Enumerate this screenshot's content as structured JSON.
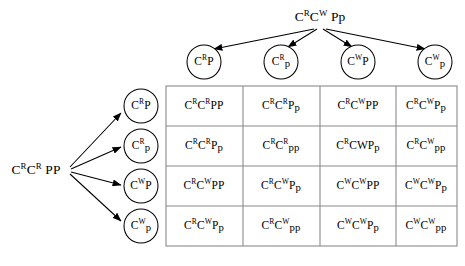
{
  "diagram": {
    "type": "punnett-square",
    "background_color": "#ffffff",
    "line_color": "#000000",
    "grid_border_color": "#8a8a8a"
  },
  "parents": {
    "top": {
      "segments": [
        {
          "t": "C",
          "style": "normal"
        },
        {
          "t": "R",
          "style": "sup"
        },
        {
          "t": "C",
          "style": "normal"
        },
        {
          "t": "W",
          "style": "sup"
        },
        {
          "t": " Pp",
          "style": "normal"
        }
      ],
      "plain": "CᴿCᵂ Pp",
      "x": 320,
      "y": 17
    },
    "left": {
      "segments": [
        {
          "t": "C",
          "style": "normal"
        },
        {
          "t": "R",
          "style": "sup"
        },
        {
          "t": "C",
          "style": "normal"
        },
        {
          "t": "R",
          "style": "sup"
        },
        {
          "t": " PP",
          "style": "normal"
        }
      ],
      "plain": "CᴿCᴿ PP",
      "x": 36,
      "y": 170
    }
  },
  "top_gametes": [
    {
      "plain": "CᴿP",
      "segments": [
        {
          "t": "C",
          "style": "normal"
        },
        {
          "t": "R",
          "style": "sup"
        },
        {
          "t": "P",
          "style": "normal"
        }
      ],
      "cx": 204,
      "cy": 62
    },
    {
      "plain": "Cᴿp",
      "segments": [
        {
          "t": "C",
          "style": "normal"
        },
        {
          "t": "R",
          "style": "sup"
        },
        {
          "t": "p",
          "style": "lower"
        }
      ],
      "cx": 281,
      "cy": 62
    },
    {
      "plain": "CᵂP",
      "segments": [
        {
          "t": "C",
          "style": "normal"
        },
        {
          "t": "W",
          "style": "sup"
        },
        {
          "t": "P",
          "style": "normal"
        }
      ],
      "cx": 358,
      "cy": 62
    },
    {
      "plain": "Cᵂp",
      "segments": [
        {
          "t": "C",
          "style": "normal"
        },
        {
          "t": "W",
          "style": "sup"
        },
        {
          "t": "p",
          "style": "lower"
        }
      ],
      "cx": 435,
      "cy": 62
    }
  ],
  "left_gametes": [
    {
      "plain": "CᴿP",
      "segments": [
        {
          "t": "C",
          "style": "normal"
        },
        {
          "t": "R",
          "style": "sup"
        },
        {
          "t": "P",
          "style": "normal"
        }
      ],
      "cx": 141,
      "cy": 106
    },
    {
      "plain": "Cᴿp",
      "segments": [
        {
          "t": "C",
          "style": "normal"
        },
        {
          "t": "R",
          "style": "sup"
        },
        {
          "t": "p",
          "style": "lower"
        }
      ],
      "cx": 141,
      "cy": 146
    },
    {
      "plain": "CᵂP",
      "segments": [
        {
          "t": "C",
          "style": "normal"
        },
        {
          "t": "W",
          "style": "sup"
        },
        {
          "t": "P",
          "style": "normal"
        }
      ],
      "cx": 141,
      "cy": 186
    },
    {
      "plain": "Cᵂp",
      "segments": [
        {
          "t": "C",
          "style": "normal"
        },
        {
          "t": "W",
          "style": "sup"
        },
        {
          "t": "p",
          "style": "lower"
        }
      ],
      "cx": 141,
      "cy": 226
    }
  ],
  "grid": {
    "left": 166,
    "top": 86,
    "right": 457,
    "bottom": 246,
    "col_x": [
      166,
      243,
      320,
      396,
      457
    ],
    "row_y": [
      86,
      126,
      166,
      206,
      246
    ],
    "rows": [
      [
        {
          "plain": "CᴿCᴿPP",
          "segments": [
            {
              "t": "C",
              "style": "normal"
            },
            {
              "t": "R",
              "style": "sup"
            },
            {
              "t": "C",
              "style": "normal"
            },
            {
              "t": "R",
              "style": "sup"
            },
            {
              "t": "PP",
              "style": "normal"
            }
          ]
        },
        {
          "plain": "CᴿCᴿPp",
          "segments": [
            {
              "t": "C",
              "style": "normal"
            },
            {
              "t": "R",
              "style": "sup"
            },
            {
              "t": "C",
              "style": "normal"
            },
            {
              "t": "R",
              "style": "sup"
            },
            {
              "t": "P",
              "style": "normal"
            },
            {
              "t": "p",
              "style": "lower"
            }
          ]
        },
        {
          "plain": "CᴿCᵂPP",
          "segments": [
            {
              "t": "C",
              "style": "normal"
            },
            {
              "t": "R",
              "style": "sup"
            },
            {
              "t": "C",
              "style": "normal"
            },
            {
              "t": "W",
              "style": "sup"
            },
            {
              "t": "PP",
              "style": "normal"
            }
          ]
        },
        {
          "plain": "CᴿCᵂPp",
          "segments": [
            {
              "t": "C",
              "style": "normal"
            },
            {
              "t": "R",
              "style": "sup"
            },
            {
              "t": "C",
              "style": "normal"
            },
            {
              "t": "W",
              "style": "sup"
            },
            {
              "t": "P",
              "style": "normal"
            },
            {
              "t": "p",
              "style": "lower"
            }
          ]
        }
      ],
      [
        {
          "plain": "CᴿCᴿPp",
          "segments": [
            {
              "t": "C",
              "style": "normal"
            },
            {
              "t": "R",
              "style": "sup"
            },
            {
              "t": "C",
              "style": "normal"
            },
            {
              "t": "R",
              "style": "sup"
            },
            {
              "t": "P",
              "style": "normal"
            },
            {
              "t": "p",
              "style": "lower"
            }
          ]
        },
        {
          "plain": "CᴿCᴿpp",
          "segments": [
            {
              "t": "C",
              "style": "normal"
            },
            {
              "t": "R",
              "style": "sup"
            },
            {
              "t": "C",
              "style": "normal"
            },
            {
              "t": "R",
              "style": "sup"
            },
            {
              "t": "pp",
              "style": "lower"
            }
          ]
        },
        {
          "plain": "CᴿCWPp",
          "segments": [
            {
              "t": "C",
              "style": "normal"
            },
            {
              "t": "R",
              "style": "sup"
            },
            {
              "t": "CWP",
              "style": "normal"
            },
            {
              "t": "p",
              "style": "lower"
            }
          ]
        },
        {
          "plain": "CᴿCᵂpp",
          "segments": [
            {
              "t": "C",
              "style": "normal"
            },
            {
              "t": "R",
              "style": "sup"
            },
            {
              "t": "C",
              "style": "normal"
            },
            {
              "t": "W",
              "style": "sup"
            },
            {
              "t": "pp",
              "style": "lower"
            }
          ]
        }
      ],
      [
        {
          "plain": "CᴿCᵂPP",
          "segments": [
            {
              "t": "C",
              "style": "normal"
            },
            {
              "t": "R",
              "style": "sup"
            },
            {
              "t": "C",
              "style": "normal"
            },
            {
              "t": "W",
              "style": "sup"
            },
            {
              "t": "PP",
              "style": "normal"
            }
          ]
        },
        {
          "plain": "CᴿCᵂPp",
          "segments": [
            {
              "t": "C",
              "style": "normal"
            },
            {
              "t": "R",
              "style": "sup"
            },
            {
              "t": "C",
              "style": "normal"
            },
            {
              "t": "W",
              "style": "sup"
            },
            {
              "t": "P",
              "style": "normal"
            },
            {
              "t": "p",
              "style": "lower"
            }
          ]
        },
        {
          "plain": "CᵂCᵂPP",
          "segments": [
            {
              "t": "C",
              "style": "normal"
            },
            {
              "t": "W",
              "style": "sup"
            },
            {
              "t": "C",
              "style": "normal"
            },
            {
              "t": "W",
              "style": "sup"
            },
            {
              "t": "PP",
              "style": "normal"
            }
          ]
        },
        {
          "plain": "CᵂCᵂPp",
          "segments": [
            {
              "t": "C",
              "style": "normal"
            },
            {
              "t": "W",
              "style": "sup"
            },
            {
              "t": "C",
              "style": "normal"
            },
            {
              "t": "W",
              "style": "sup"
            },
            {
              "t": "P",
              "style": "normal"
            },
            {
              "t": "p",
              "style": "lower"
            }
          ]
        }
      ],
      [
        {
          "plain": "CᴿCᵂPp",
          "segments": [
            {
              "t": "C",
              "style": "normal"
            },
            {
              "t": "R",
              "style": "sup"
            },
            {
              "t": "C",
              "style": "normal"
            },
            {
              "t": "W",
              "style": "sup"
            },
            {
              "t": "P",
              "style": "normal"
            },
            {
              "t": "p",
              "style": "lower"
            }
          ]
        },
        {
          "plain": "CᴿCᵂpp",
          "segments": [
            {
              "t": "C",
              "style": "normal"
            },
            {
              "t": "R",
              "style": "sup"
            },
            {
              "t": "C",
              "style": "normal"
            },
            {
              "t": "W",
              "style": "sup"
            },
            {
              "t": "pp",
              "style": "lower"
            }
          ]
        },
        {
          "plain": "CᵂCᵂPp",
          "segments": [
            {
              "t": "C",
              "style": "normal"
            },
            {
              "t": "W",
              "style": "sup"
            },
            {
              "t": "C",
              "style": "normal"
            },
            {
              "t": "W",
              "style": "sup"
            },
            {
              "t": "P",
              "style": "normal"
            },
            {
              "t": "p",
              "style": "lower"
            }
          ]
        },
        {
          "plain": "CᵂCᵂpp",
          "segments": [
            {
              "t": "C",
              "style": "normal"
            },
            {
              "t": "W",
              "style": "sup"
            },
            {
              "t": "C",
              "style": "normal"
            },
            {
              "t": "W",
              "style": "sup"
            },
            {
              "t": "pp",
              "style": "lower"
            }
          ]
        }
      ]
    ]
  },
  "arrows": {
    "top_origin": {
      "x": 320,
      "y": 29
    },
    "left_origin": {
      "x": 68,
      "y": 170
    },
    "circle_radius": 17
  }
}
